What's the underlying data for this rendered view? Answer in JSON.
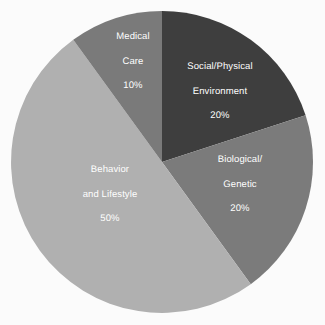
{
  "background_color": "#fbfbfb",
  "chart_data": {
    "type": "pie",
    "title": "",
    "subtitle": "",
    "xlabel": "",
    "ylabel": "",
    "legend_position": "none",
    "labels_inside_slices": true,
    "label_text_color": "#ffffff",
    "start_angle_deg": 0,
    "direction": "clockwise",
    "center": {
      "x": 162,
      "y": 162
    },
    "radius": 151,
    "categories": [
      "Social/Physical Environment",
      "Biological/Genetic",
      "Behavior and Lifestyle",
      "Medical Care"
    ],
    "values": [
      20,
      20,
      50,
      10
    ],
    "value_unit": "%",
    "colors": [
      "#3e3e3e",
      "#7b7b7b",
      "#b0b0b0",
      "#7a7a7a"
    ],
    "slices": [
      {
        "name": "Social/Physical Environment",
        "label_line1": "Social/Physical",
        "label_line2": "Environment",
        "value": 20,
        "value_label": "20%",
        "color": "#3e3e3e",
        "start_deg": 0,
        "end_deg": 72
      },
      {
        "name": "Biological/Genetic",
        "label_line1": "Biological/",
        "label_line2": "Genetic",
        "value": 20,
        "value_label": "20%",
        "color": "#7b7b7b",
        "start_deg": 72,
        "end_deg": 144
      },
      {
        "name": "Behavior and Lifestyle",
        "label_line1": "Behavior",
        "label_line2": "and Lifestyle",
        "value": 50,
        "value_label": "50%",
        "color": "#b0b0b0",
        "start_deg": 144,
        "end_deg": 324
      },
      {
        "name": "Medical Care",
        "label_line1": "Medical",
        "label_line2": "Care",
        "value": 10,
        "value_label": "10%",
        "color": "#7a7a7a",
        "start_deg": 324,
        "end_deg": 360
      }
    ]
  }
}
